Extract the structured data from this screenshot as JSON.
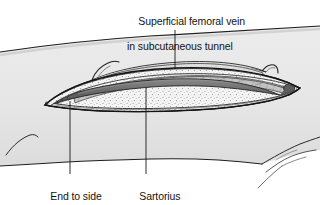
{
  "figure": {
    "type": "medical-illustration",
    "background_color": "#ffffff",
    "line_color": "#1a1a1a",
    "skin_fill": "#e9e9e9",
    "skin_shadow": "#d8d8d8",
    "fat_fill": "#f4f4f4",
    "vein_fill": "#6f6f6f",
    "vein_dark": "#4a4a4a",
    "muscle_fill": "#bdbdbd",
    "tunnel_fill": "#dcdcdc",
    "text_color": "#131313"
  },
  "labels": {
    "vein": {
      "line1": "Superficial femoral vein",
      "line2": "in subcutaneous tunnel"
    },
    "anastomosis": {
      "line1": "End to side",
      "line2": "anastomosis"
    },
    "sartorius": {
      "line1": "Sartorius",
      "line2": "muscle"
    }
  },
  "leader_lines": [
    {
      "name": "vein-leader",
      "x": 175,
      "y1": 30,
      "y2": 69
    },
    {
      "name": "anastomosis-leader",
      "x": 70,
      "y1": 101,
      "y2": 174
    },
    {
      "name": "sartorius-leader",
      "x": 146,
      "y1": 88,
      "y2": 174
    }
  ]
}
